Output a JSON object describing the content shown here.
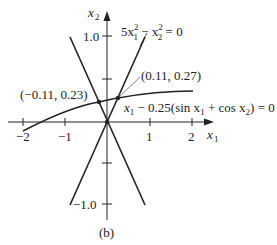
{
  "figure": {
    "caption": "(b)",
    "colors": {
      "ink": "#222222",
      "background": "#ffffff"
    }
  },
  "axes": {
    "x_label": "x",
    "x_label_sub": "1",
    "y_label": "x",
    "y_label_sub": "2",
    "x_ticks": [
      {
        "value": -2,
        "label": "−2"
      },
      {
        "value": -1,
        "label": "−1"
      },
      {
        "value": 1,
        "label": "1"
      },
      {
        "value": 2,
        "label": "2"
      }
    ],
    "y_ticks": [
      {
        "value": 1.0,
        "label": "1.0"
      },
      {
        "value": 0.5,
        "label": ""
      },
      {
        "value": -0.5,
        "label": ""
      },
      {
        "value": -1.0,
        "label": "−1.0"
      }
    ]
  },
  "curves": {
    "lines_equation": "5x₁² − x₂² = 0",
    "curve_equation": "x₁ − 0.25(sin x₁ + cos x₂) = 0"
  },
  "labels": {
    "eq_lines_a": "5x",
    "eq_lines_sup1": "2",
    "eq_lines_sub1": "1",
    "eq_lines_b": " − x",
    "eq_lines_sup2": "2",
    "eq_lines_sub2": "2",
    "eq_lines_c": " = 0",
    "eq_curve_a": "x",
    "eq_curve_sub1": "1",
    "eq_curve_b": " − 0.25(sin x",
    "eq_curve_sub2": "1",
    "eq_curve_c": " + cos x",
    "eq_curve_sub3": "2",
    "eq_curve_d": ") = 0"
  },
  "points": [
    {
      "label": "(−0.11, 0.23)",
      "x": -0.11,
      "y": 0.23
    },
    {
      "label": "(0.11, 0.27)",
      "x": 0.11,
      "y": 0.27
    }
  ]
}
